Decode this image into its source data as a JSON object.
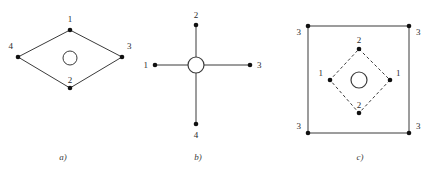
{
  "figure": {
    "background_color": "#ffffff",
    "line_color": "#3b3b3b",
    "node_color": "#111111",
    "label_color": "#2b2b2b",
    "caption_text": "",
    "panels": [
      {
        "id": "a",
        "caption": "a)",
        "caption_x": 63,
        "caption_y": 155,
        "shape": "diamond-solid",
        "center": {
          "x": 70,
          "y": 58
        },
        "hub_radius": 7,
        "vertices": [
          {
            "label": "1",
            "x": 70,
            "y": 30,
            "label_x": 70,
            "label_y": 22
          },
          {
            "label": "2",
            "x": 70,
            "y": 88,
            "label_x": 70,
            "label_y": 83
          },
          {
            "label": "3",
            "x": 122,
            "y": 57,
            "label_x": 127,
            "label_y": 49
          },
          {
            "label": "4",
            "x": 18,
            "y": 57,
            "label_x": 13,
            "label_y": 49
          }
        ]
      },
      {
        "id": "b",
        "caption": "b)",
        "caption_x": 198,
        "caption_y": 155,
        "shape": "cross-solid",
        "center": {
          "x": 196,
          "y": 65
        },
        "hub_radius": 8,
        "vertices": [
          {
            "label": "1",
            "x": 155,
            "y": 65,
            "label_x": 148,
            "label_y": 68
          },
          {
            "label": "2",
            "x": 196,
            "y": 25,
            "label_x": 196,
            "label_y": 17
          },
          {
            "label": "3",
            "x": 250,
            "y": 65,
            "label_x": 257,
            "label_y": 68
          },
          {
            "label": "4",
            "x": 196,
            "y": 124,
            "label_x": 196,
            "label_y": 138
          }
        ]
      },
      {
        "id": "c",
        "caption": "c)",
        "caption_x": 360,
        "caption_y": 155,
        "shape": "square-solid-with-dashed-diamond",
        "center": {
          "x": 359,
          "y": 80
        },
        "hub_radius": 8,
        "square": {
          "left": 308,
          "top": 26,
          "right": 409,
          "bottom": 133
        },
        "corner_labels": [
          {
            "label": "3",
            "x": 308,
            "y": 26,
            "label_x": 300,
            "label_y": 34
          },
          {
            "label": "3",
            "x": 409,
            "y": 26,
            "label_x": 417,
            "label_y": 34
          },
          {
            "label": "3",
            "x": 308,
            "y": 133,
            "label_x": 300,
            "label_y": 128
          },
          {
            "label": "3",
            "x": 409,
            "y": 133,
            "label_x": 417,
            "label_y": 128
          }
        ],
        "vertices": [
          {
            "label": "2",
            "x": 359,
            "y": 49,
            "label_x": 359,
            "label_y": 42
          },
          {
            "label": "1",
            "x": 330,
            "y": 80,
            "label_x": 322,
            "label_y": 75
          },
          {
            "label": "1",
            "x": 390,
            "y": 80,
            "label_x": 398,
            "label_y": 75
          },
          {
            "label": "2",
            "x": 359,
            "y": 113,
            "label_x": 359,
            "label_y": 108
          }
        ]
      }
    ]
  }
}
